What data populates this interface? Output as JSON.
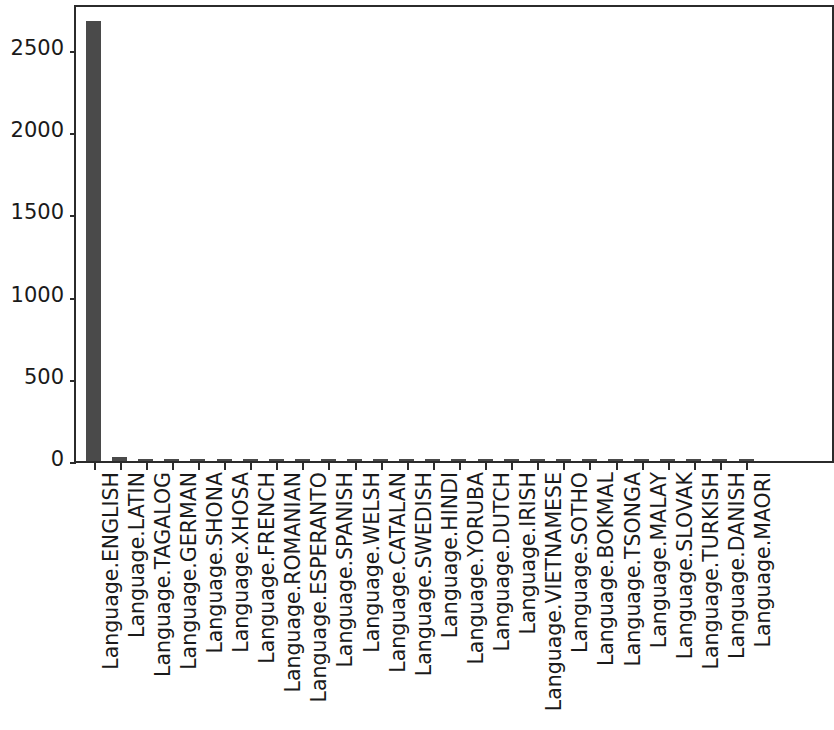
{
  "chart_data": {
    "type": "bar",
    "title": "",
    "xlabel": "",
    "ylabel": "",
    "ylim": [
      0,
      2750
    ],
    "yticks": [
      0,
      500,
      1000,
      1500,
      2000,
      2500
    ],
    "ytick_labels": [
      "0",
      "500",
      "1000",
      "1500",
      "2000",
      "2500"
    ],
    "grid": false,
    "legend": false,
    "bar_color": "#4a4a4a",
    "axis_color": "#2b2b2b",
    "background_color": "#ffffff",
    "note": "x tick labels are rotated 90 degrees; the rightmost category is clipped by the figure edge",
    "categories": [
      "Language.ENGLISH",
      "Language.LATIN",
      "Language.TAGALOG",
      "Language.GERMAN",
      "Language.SHONA",
      "Language.XHOSA",
      "Language.FRENCH",
      "Language.ROMANIAN",
      "Language.ESPERANTO",
      "Language.SPANISH",
      "Language.WELSH",
      "Language.CATALAN",
      "Language.SWEDISH",
      "Language.HINDI",
      "Language.YORUBA",
      "Language.DUTCH",
      "Language.IRISH",
      "Language.VIETNAMESE",
      "Language.SOTHO",
      "Language.BOKMAL",
      "Language.TSONGA",
      "Language.MALAY",
      "Language.SLOVAK",
      "Language.TURKISH",
      "Language.DANISH",
      "Language.MAORI"
    ],
    "values": [
      2675,
      26,
      12,
      6,
      5,
      5,
      4,
      4,
      3,
      3,
      3,
      2,
      2,
      2,
      2,
      2,
      2,
      1,
      1,
      1,
      1,
      1,
      1,
      1,
      1,
      1
    ]
  }
}
